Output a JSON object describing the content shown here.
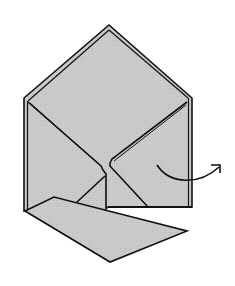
{
  "diagram": {
    "type": "origami-fold-step",
    "colors": {
      "paper_fill": "#c9c9c9",
      "outline": "#111111",
      "background": "#ffffff"
    },
    "elements": {
      "body": {
        "label": "folded paper body"
      },
      "top_flap": {
        "label": "triangular top flap"
      },
      "bottom_flap": {
        "label": "folded-down bottom flap"
      },
      "arrow": {
        "label": "curved fold arrow",
        "direction": "right",
        "icon": "curved-arrow-icon"
      }
    }
  }
}
